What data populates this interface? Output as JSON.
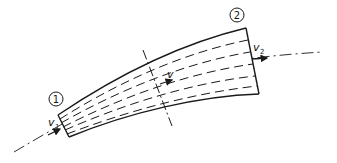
{
  "diagram": {
    "type": "stream-tube",
    "stroke_color": "#1a1a1a",
    "sections": [
      {
        "id": "section-1",
        "label": "1"
      },
      {
        "id": "section-2",
        "label": "2"
      }
    ],
    "velocities": [
      {
        "id": "v1",
        "symbol": "v",
        "subscript": "1"
      },
      {
        "id": "v",
        "symbol": "v",
        "subscript": ""
      },
      {
        "id": "v2",
        "symbol": "v",
        "subscript": "2"
      }
    ]
  }
}
